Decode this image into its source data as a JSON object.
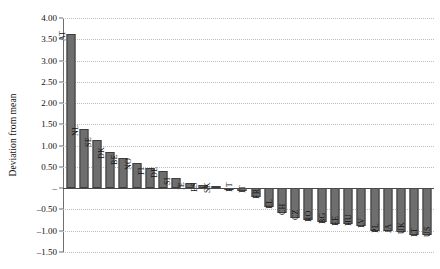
{
  "chart_data": {
    "type": "bar",
    "title": "",
    "subtitle": "",
    "xlabel": "",
    "ylabel": "Deviation from mean",
    "ylim": [
      -1.5,
      4.0
    ],
    "ytick_step": 0.5,
    "ytick_labels": [
      "4.00",
      "3.50",
      "3.00",
      "2.50",
      "2.00",
      "1.50",
      "1.00",
      "0.50",
      "–",
      "–0.50",
      "–1.00",
      "–1.50"
    ],
    "ytick_values": [
      4.0,
      3.5,
      3.0,
      2.5,
      2.0,
      1.5,
      1.0,
      0.5,
      0.0,
      -0.5,
      -1.0,
      -1.5
    ],
    "grid": true,
    "grid_style": "dotted",
    "legend": false,
    "legend_position": "none",
    "bar_color": "#6e6e6e",
    "bar_edge_color": "#3d3d3d",
    "categories": [
      "AT",
      "NL",
      "SE",
      "DK",
      "BE",
      "NO",
      "FI",
      "DE",
      "SI",
      "IE",
      "ES",
      "SK",
      "PT",
      "IT",
      "FR",
      "EL",
      "CH",
      "CZ",
      "RO",
      "BG",
      "EE",
      "HU",
      "LV",
      "PL",
      "JA",
      "UK",
      "LT",
      "US"
    ],
    "values": [
      3.62,
      1.39,
      1.14,
      0.84,
      0.7,
      0.59,
      0.47,
      0.41,
      0.25,
      0.12,
      0.08,
      0.05,
      -0.04,
      -0.06,
      -0.2,
      -0.45,
      -0.58,
      -0.7,
      -0.74,
      -0.79,
      -0.84,
      -0.85,
      -0.88,
      -1.0,
      -1.01,
      -1.03,
      -1.1,
      -1.11
    ]
  }
}
